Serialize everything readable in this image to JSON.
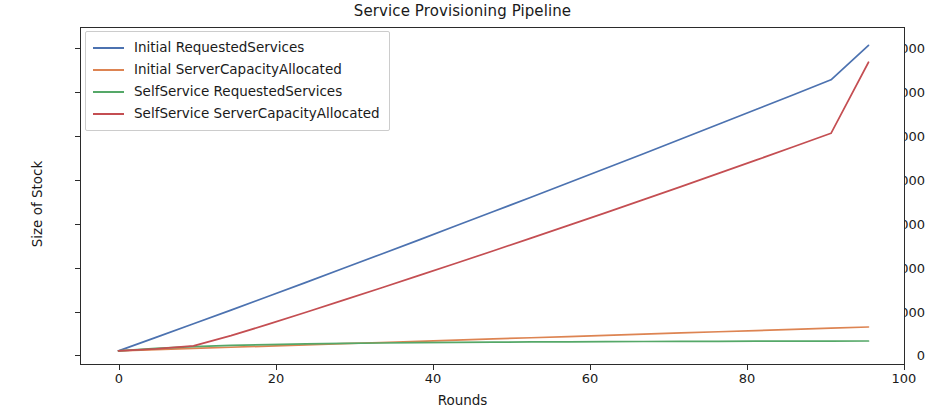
{
  "chart_data": {
    "type": "line",
    "title": "Service Provisioning Pipeline",
    "xlabel": "Rounds",
    "ylabel": "Size of Stock",
    "xlim": [
      -5,
      105
    ],
    "ylim": [
      -700,
      14900
    ],
    "xticks": [
      0,
      20,
      40,
      60,
      80,
      100
    ],
    "yticks": [
      0,
      2000,
      4000,
      6000,
      8000,
      10000,
      12000,
      14000
    ],
    "xtick_labels": [
      "0",
      "20",
      "40",
      "60",
      "80",
      "100"
    ],
    "ytick_labels": [
      "0",
      "2000",
      "4000",
      "6000",
      "8000",
      "10000",
      "12000",
      "14000"
    ],
    "grid": false,
    "legend_position": "upper left",
    "x": [
      0,
      5,
      10,
      15,
      20,
      25,
      30,
      35,
      40,
      45,
      50,
      55,
      60,
      65,
      70,
      75,
      80,
      85,
      90,
      95,
      100
    ],
    "series": [
      {
        "name": "Initial RequestedServices",
        "color": "#4c72b0",
        "values": [
          0,
          620,
          1250,
          1880,
          2520,
          3160,
          3810,
          4460,
          5110,
          5770,
          6430,
          7090,
          7760,
          8430,
          9100,
          9780,
          10460,
          11140,
          11820,
          12510,
          14100
        ]
      },
      {
        "name": "Initial ServerCapacityAllocated",
        "color": "#dd8452",
        "values": [
          0,
          55,
          110,
          165,
          220,
          275,
          330,
          385,
          440,
          495,
          550,
          605,
          660,
          715,
          770,
          825,
          880,
          935,
          990,
          1045,
          1100
        ]
      },
      {
        "name": "SelfService RequestedServices",
        "color": "#55a868",
        "values": [
          0,
          110,
          195,
          250,
          290,
          320,
          345,
          362,
          378,
          390,
          400,
          410,
          418,
          424,
          430,
          436,
          440,
          444,
          448,
          450,
          455
        ]
      },
      {
        "name": "SelfService ServerCapacityAllocated",
        "color": "#c44e52",
        "values": [
          0,
          90,
          230,
          700,
          1230,
          1780,
          2340,
          2900,
          3470,
          4040,
          4620,
          5200,
          5790,
          6380,
          6980,
          7580,
          8190,
          8800,
          9420,
          10040,
          13320
        ]
      }
    ]
  }
}
